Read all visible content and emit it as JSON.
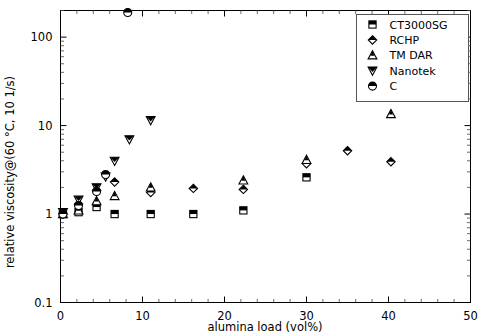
{
  "chart_data": {
    "type": "scatter",
    "title": "",
    "xlabel": "alumina load (vol%)",
    "ylabel": "relative viscosity@(60 °C, 10 1/s)",
    "xlim": [
      0,
      50
    ],
    "ylim": [
      0.1,
      200
    ],
    "yscale": "log",
    "xscale": "linear",
    "grid": false,
    "legend_position": "top-right",
    "xticklabels": [
      "0",
      "10",
      "20",
      "30",
      "40",
      "50"
    ],
    "xtickvalues": [
      0,
      10,
      20,
      30,
      40,
      50
    ],
    "yticklabels": [
      "0.1",
      "1",
      "10",
      "100"
    ],
    "ytickvalues": [
      0.1,
      1,
      10,
      100
    ],
    "series": [
      {
        "name": "CT3000SG",
        "marker": "square-half-filled",
        "points": [
          {
            "x": 0.3,
            "y": 1.0
          },
          {
            "x": 2.2,
            "y": 1.05
          },
          {
            "x": 4.4,
            "y": 1.2
          },
          {
            "x": 6.6,
            "y": 1.0
          },
          {
            "x": 11.0,
            "y": 1.0
          },
          {
            "x": 16.2,
            "y": 1.0
          },
          {
            "x": 22.3,
            "y": 1.1
          },
          {
            "x": 30.0,
            "y": 2.6
          }
        ]
      },
      {
        "name": "RCHP",
        "marker": "diamond",
        "points": [
          {
            "x": 0.3,
            "y": 1.0
          },
          {
            "x": 2.2,
            "y": 1.3
          },
          {
            "x": 4.4,
            "y": 1.85
          },
          {
            "x": 6.6,
            "y": 2.3
          },
          {
            "x": 11.0,
            "y": 1.75
          },
          {
            "x": 16.2,
            "y": 1.95
          },
          {
            "x": 22.3,
            "y": 1.9
          },
          {
            "x": 30.0,
            "y": 3.7
          },
          {
            "x": 35.0,
            "y": 5.2
          },
          {
            "x": 40.3,
            "y": 3.9
          },
          {
            "x": 46.2,
            "y": 21.0
          }
        ]
      },
      {
        "name": "TM DAR",
        "marker": "triangle-up",
        "points": [
          {
            "x": 0.3,
            "y": 1.0
          },
          {
            "x": 2.2,
            "y": 1.1
          },
          {
            "x": 4.4,
            "y": 1.4
          },
          {
            "x": 6.6,
            "y": 1.6
          },
          {
            "x": 11.0,
            "y": 2.0
          },
          {
            "x": 22.3,
            "y": 2.4
          },
          {
            "x": 30.0,
            "y": 4.1
          },
          {
            "x": 40.3,
            "y": 13.5
          }
        ]
      },
      {
        "name": "Nanotek",
        "marker": "triangle-down",
        "points": [
          {
            "x": 0.3,
            "y": 1.05
          },
          {
            "x": 2.2,
            "y": 1.45
          },
          {
            "x": 4.4,
            "y": 2.0
          },
          {
            "x": 5.5,
            "y": 2.65
          },
          {
            "x": 6.6,
            "y": 4.0
          },
          {
            "x": 8.4,
            "y": 7.0
          },
          {
            "x": 11.0,
            "y": 11.5
          }
        ]
      },
      {
        "name": "C",
        "marker": "circle-half-filled",
        "points": [
          {
            "x": 0.3,
            "y": 1.0
          },
          {
            "x": 2.2,
            "y": 1.25
          },
          {
            "x": 4.4,
            "y": 1.8
          },
          {
            "x": 5.5,
            "y": 2.8
          },
          {
            "x": 8.2,
            "y": 190.0
          }
        ]
      }
    ]
  },
  "legend": {
    "entries": [
      {
        "label": "CT3000SG",
        "marker": "square-half-filled"
      },
      {
        "label": "RCHP",
        "marker": "diamond"
      },
      {
        "label": "TM DAR",
        "marker": "triangle-up"
      },
      {
        "label": "Nanotek",
        "marker": "triangle-down"
      },
      {
        "label": "C",
        "marker": "circle-half-filled"
      }
    ]
  },
  "colors": {
    "marker": "#000000",
    "axis": "#000000",
    "background": "#ffffff",
    "legend_border": "#555555"
  }
}
